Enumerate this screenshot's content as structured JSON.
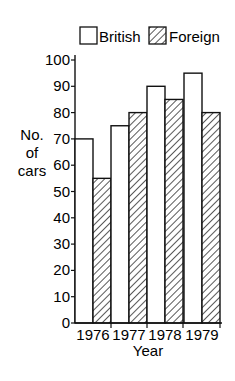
{
  "chart_data": {
    "type": "bar",
    "title": "",
    "xlabel": "Year",
    "ylabel": "No. of cars",
    "ylabel_lines": [
      "No.",
      "of",
      "cars"
    ],
    "categories": [
      "1976",
      "1977",
      "1978",
      "1979"
    ],
    "series": [
      {
        "name": "British",
        "values": [
          70,
          75,
          90,
          95
        ],
        "fill": "white"
      },
      {
        "name": "Foreign",
        "values": [
          55,
          80,
          85,
          80
        ],
        "fill": "hatched"
      }
    ],
    "ylim": [
      0,
      100
    ],
    "yticks": [
      0,
      10,
      20,
      30,
      40,
      50,
      60,
      70,
      80,
      90,
      100
    ],
    "grid": false,
    "legend_position": "top"
  },
  "legend": {
    "british": "British",
    "foreign": "Foreign"
  },
  "colors": {
    "stroke": "#111111",
    "background": "#ffffff"
  }
}
